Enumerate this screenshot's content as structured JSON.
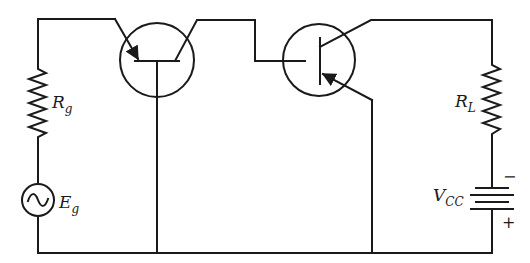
{
  "diagram": {
    "type": "transistor circuit schematic",
    "components": {
      "source_resistor": {
        "label_main": "R",
        "label_sub": "g"
      },
      "source": {
        "label_main": "E",
        "label_sub": "g",
        "symbol": "ac-sine"
      },
      "load_resistor": {
        "label_main": "R",
        "label_sub": "L"
      },
      "supply": {
        "label_main": "V",
        "label_sub": "CC",
        "minus": "−",
        "plus": "+"
      },
      "transistor_1": {
        "configuration": "common-base",
        "arrow": "emitter-in"
      },
      "transistor_2": {
        "configuration": "pnp",
        "arrow": "emitter-in"
      }
    },
    "colors": {
      "line": "#1a1a1a",
      "background": "#ffffff"
    }
  }
}
